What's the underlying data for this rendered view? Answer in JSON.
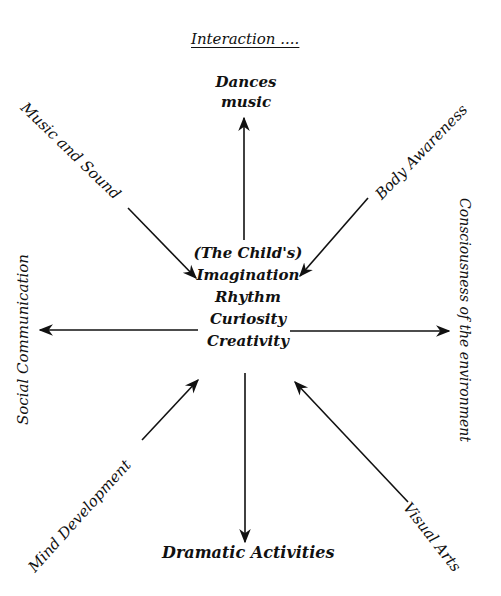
{
  "diagram": {
    "title": "Interaction ....",
    "center": {
      "line1": "(The Child's)",
      "line2": "Imagination",
      "line3": "Rhythm",
      "line4": "Curiosity",
      "line5": "Creativity"
    },
    "nodes": {
      "top": {
        "line1": "Dances",
        "line2": "music",
        "arrow_direction": "outward"
      },
      "top_left": {
        "label": "Music and Sound",
        "arrow_direction": "inward"
      },
      "top_right": {
        "label": "Body Awareness",
        "arrow_direction": "inward"
      },
      "left": {
        "label": "Social Communication",
        "arrow_direction": "outward"
      },
      "right": {
        "label": "Consciousness of the environment",
        "arrow_direction": "outward"
      },
      "bottom_left": {
        "label": "Mind Development",
        "arrow_direction": "outward"
      },
      "bottom_right": {
        "label": "Visual Arts",
        "arrow_direction": "outward"
      },
      "bottom": {
        "label": "Dramatic Activities",
        "arrow_direction": "outward"
      }
    },
    "colors": {
      "ink": "#111111",
      "background": "#ffffff"
    }
  }
}
